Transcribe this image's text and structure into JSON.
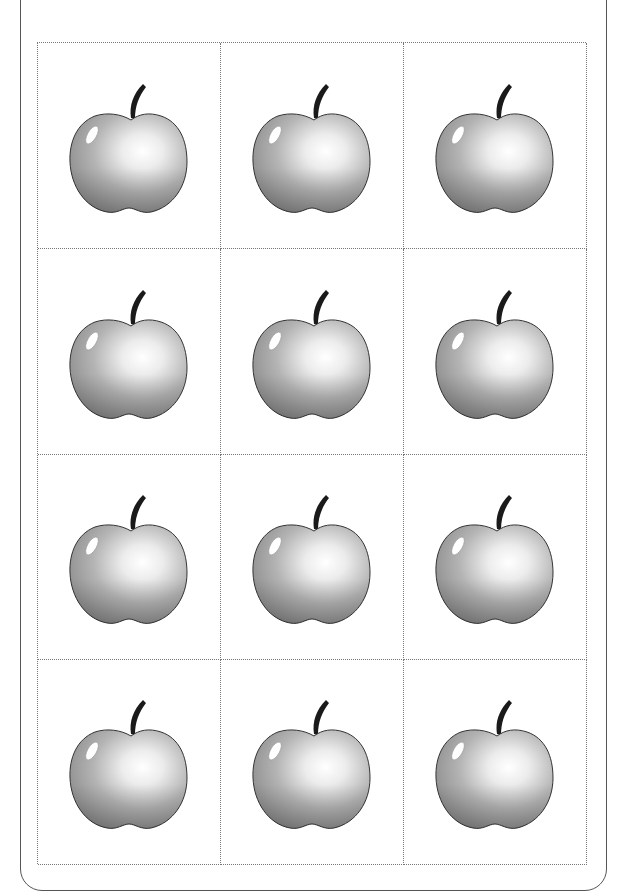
{
  "worksheet": {
    "rows": 4,
    "columns": 3,
    "cells": [
      {
        "icon": "apple-icon"
      },
      {
        "icon": "apple-icon"
      },
      {
        "icon": "apple-icon"
      },
      {
        "icon": "apple-icon"
      },
      {
        "icon": "apple-icon"
      },
      {
        "icon": "apple-icon"
      },
      {
        "icon": "apple-icon"
      },
      {
        "icon": "apple-icon"
      },
      {
        "icon": "apple-icon"
      },
      {
        "icon": "apple-icon"
      },
      {
        "icon": "apple-icon"
      },
      {
        "icon": "apple-icon"
      }
    ],
    "colors": {
      "border": "#555555",
      "grid_line": "#777777",
      "apple_dark": "#8a8a8a",
      "apple_light": "#f2f2f2",
      "stem": "#1a1a1a"
    }
  }
}
